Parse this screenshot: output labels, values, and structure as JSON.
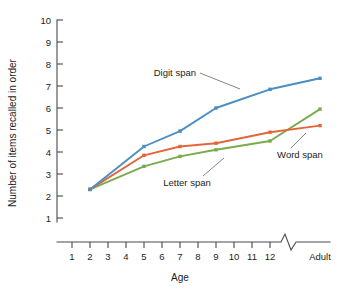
{
  "chart_data": {
    "type": "line",
    "title": "",
    "xlabel": "Age",
    "ylabel": "Number of items recalled in order",
    "x": [
      "2",
      "5",
      "7",
      "9",
      "12",
      "Adult"
    ],
    "x_tick_labels": [
      "1",
      "2",
      "3",
      "4",
      "5",
      "6",
      "7",
      "8",
      "9",
      "10",
      "11",
      "12",
      "Adult"
    ],
    "y_tick_labels": [
      "1",
      "2",
      "3",
      "4",
      "5",
      "6",
      "7",
      "8",
      "9",
      "10"
    ],
    "ylim": [
      0,
      10
    ],
    "grid": false,
    "legend": "inline-annotations",
    "axis_break": true,
    "axis_break_note": "zigzag break on x-axis between age 12 and Adult",
    "series": [
      {
        "name": "Digit span",
        "color": "#4a8ec2",
        "values": [
          2.3,
          4.25,
          4.95,
          6.0,
          6.85,
          7.35
        ]
      },
      {
        "name": "Letter span",
        "color": "#e2663c",
        "values": [
          2.3,
          3.85,
          4.25,
          4.4,
          4.9,
          5.2
        ]
      },
      {
        "name": "Word span",
        "color": "#7aab4e",
        "values": [
          2.3,
          3.35,
          3.8,
          4.1,
          4.5,
          5.95
        ]
      }
    ],
    "annotations": [
      {
        "text": "Digit span",
        "target_series": "Digit span"
      },
      {
        "text": "Letter span",
        "target_series": "Letter span"
      },
      {
        "text": "Word span",
        "target_series": "Word span"
      }
    ]
  }
}
